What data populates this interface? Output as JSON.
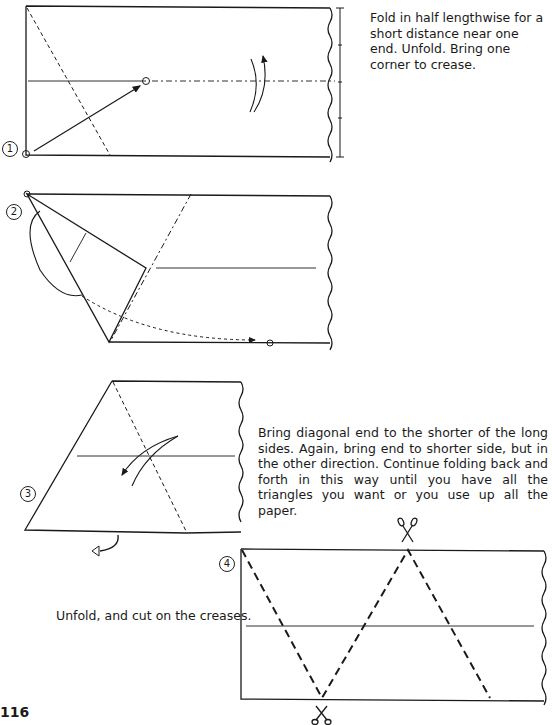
{
  "page": {
    "page_number": "116",
    "colors": {
      "ink": "#1a1a1a",
      "paper": "#ffffff"
    }
  },
  "steps": [
    {
      "number": "1",
      "text": "Fold in half lengthwise for a short distance near one end. Unfold. Bring one corner to crease."
    },
    {
      "number": "2",
      "text": ""
    },
    {
      "number": "3",
      "text": "Bring diagonal end to the shorter of the long sides. Again, bring end to shorter side, but in the other direction. Continue folding back and forth in this way until you have all the triangles you want or you use up all the paper."
    },
    {
      "number": "4",
      "text": "Unfold, and cut on the creases."
    }
  ],
  "icons": {
    "scissors_top": "scissors-icon",
    "scissors_bottom": "scissors-icon"
  }
}
